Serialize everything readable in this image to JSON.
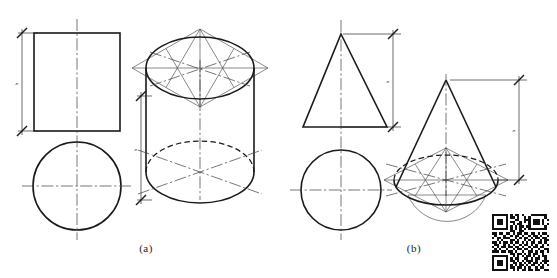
{
  "figure": {
    "background_color": "#ffffff",
    "line_color": "#1a1a1a",
    "construction_color": "#4a4a4a",
    "width": 557,
    "height": 278,
    "captions": [
      {
        "id": "caption-a",
        "label": "(a)",
        "x": 146,
        "y": 252
      },
      {
        "id": "caption-b",
        "label": "(b)",
        "x": 414,
        "y": 252
      }
    ]
  },
  "panel_a": {
    "name": "cylinder-panel",
    "caption": "(a)",
    "front_view": {
      "name": "cylinder-front-view-rectangle",
      "shape": "rectangle",
      "x": 34,
      "y": 33,
      "width": 86,
      "height": 98
    },
    "top_view": {
      "name": "cylinder-top-view-circle",
      "shape": "circle",
      "cx": 77,
      "cy": 186,
      "r": 44
    },
    "dimension": {
      "name": "cylinder-height-dimension",
      "label": "h",
      "value_text": "h",
      "x": 22,
      "y_top": 33,
      "y_bottom": 131
    },
    "isometric": {
      "name": "cylinder-isometric-view",
      "top_ellipse": {
        "cx": 200,
        "cy": 68,
        "rx": 54,
        "ry": 31
      },
      "bottom_ellipse": {
        "cx": 200,
        "cy": 172,
        "rx": 54,
        "ry": 31
      },
      "height": 104,
      "rhombus_half_width": 68,
      "rhombus_half_height": 39,
      "dimension": {
        "name": "cylinder-isometric-height-dimension",
        "label": "h",
        "x": 141,
        "y_top": 96,
        "y_bottom": 200
      }
    }
  },
  "panel_b": {
    "name": "cone-panel",
    "caption": "(b)",
    "front_view": {
      "name": "cone-front-view-triangle",
      "shape": "triangle",
      "apex_x": 341,
      "apex_y": 34,
      "base_left_x": 303,
      "base_right_x": 387,
      "base_y": 127
    },
    "top_view": {
      "name": "cone-top-view-circle",
      "shape": "circle",
      "cx": 341,
      "cy": 190,
      "r": 40
    },
    "dimension": {
      "name": "cone-height-dimension",
      "label": "h",
      "x": 393,
      "y_top": 34,
      "y_bottom": 127
    },
    "isometric": {
      "name": "cone-isometric-view",
      "apex_x": 446,
      "apex_y": 80,
      "base_ellipse": {
        "cx": 446,
        "cy": 180,
        "rx": 52,
        "ry": 25
      },
      "height": 100,
      "rhombus_half_width": 62,
      "rhombus_half_height": 32,
      "dimension": {
        "name": "cone-isometric-height-dimension",
        "label": "h",
        "x": 519,
        "y_top": 80,
        "y_bottom": 180
      }
    }
  },
  "qr_code": {
    "name": "qr-code",
    "x": 492,
    "y": 214,
    "size": 57,
    "modules": 25,
    "dark_color": "#111111",
    "light_color": "#ffffff",
    "matrix": [
      "1111111010110100011111110",
      "1000001011010010100000010",
      "1011101000110011101110101",
      "1011101011001010101110100",
      "1011101001011000101110101",
      "1000001010101101100000010",
      "1111111010101010111111110",
      "0000000011001100000000000",
      "1101101101011011011010110",
      "0100010010110100101101001",
      "1011011100101011010110110",
      "0010100011010010101001011",
      "1101011010110101011011010",
      "0110010101001011010100101",
      "1010110110110100101101100",
      "0101001001011011010010011",
      "1110110110100100110101101",
      "0000000011011010101100100",
      "1111111001010101101010110",
      "1000001010110011010110010",
      "1011101011010101110100111",
      "1011101001101010101101010",
      "1011101010101101011010101",
      "1000001011011010100101100",
      "1111111001010110110110011"
    ]
  }
}
